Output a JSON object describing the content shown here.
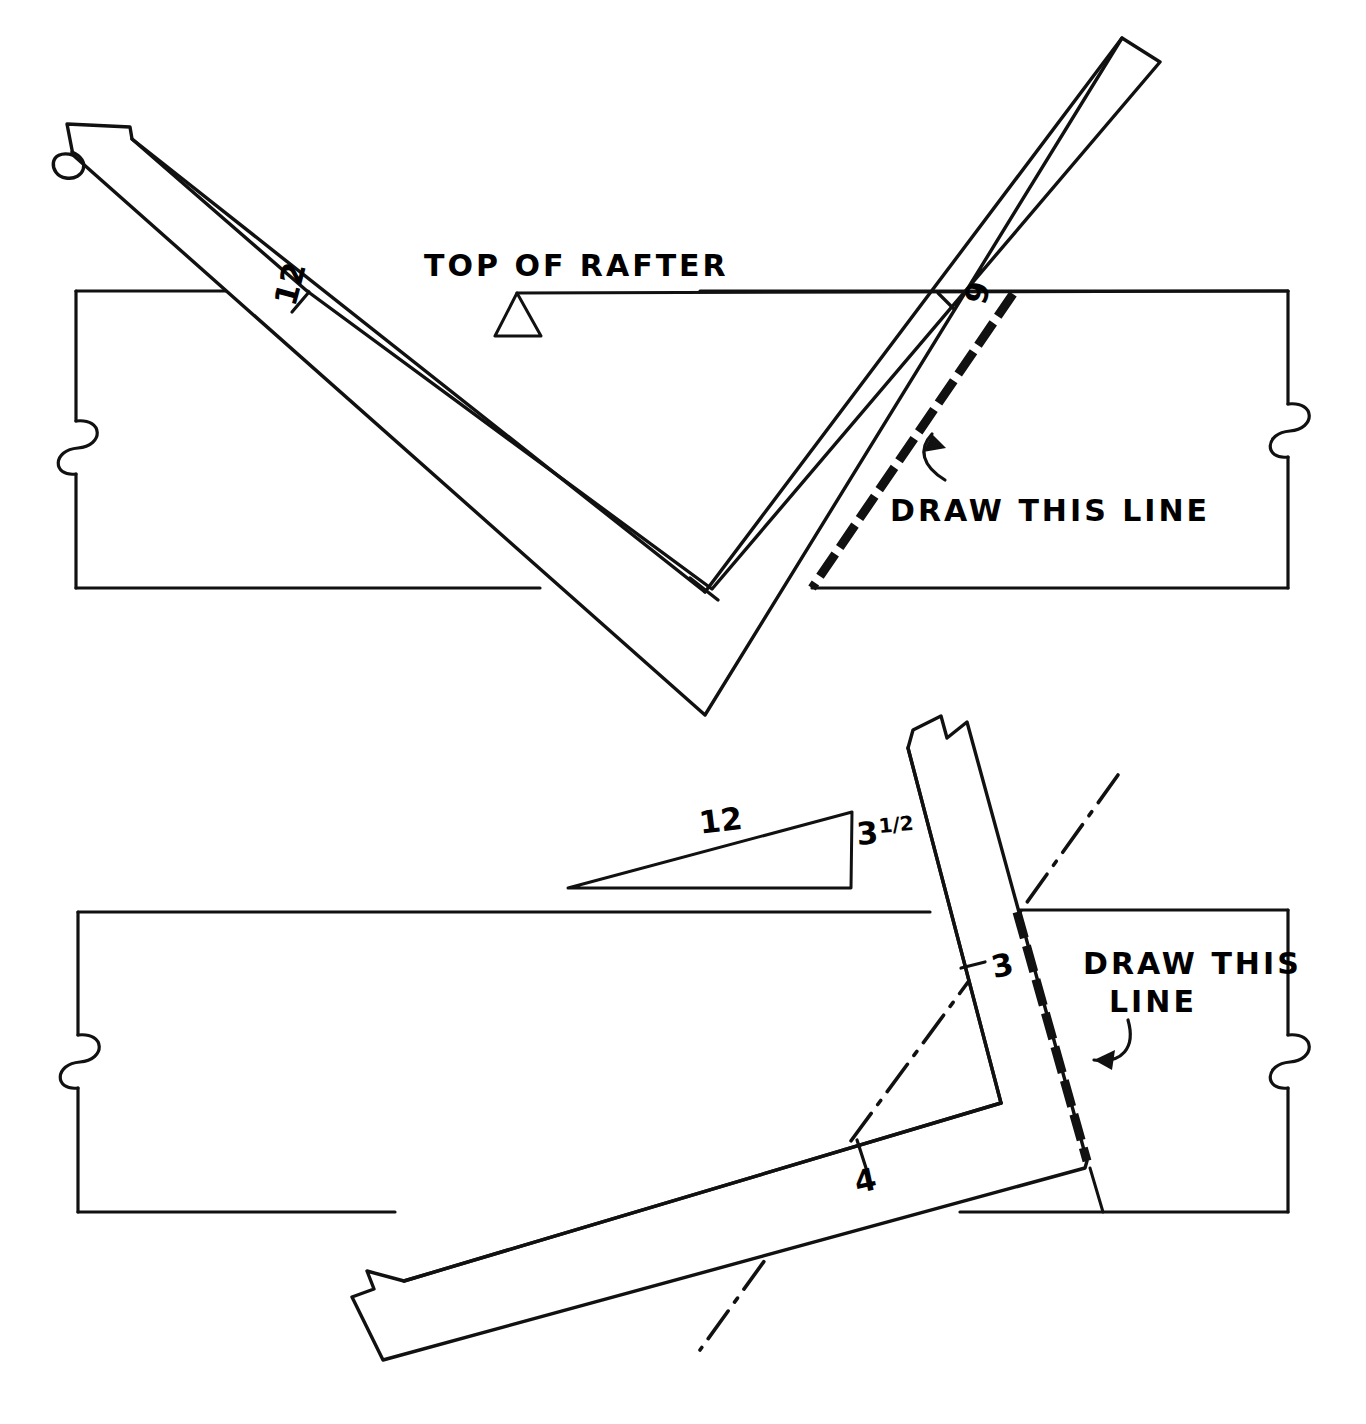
{
  "document": {
    "title": "Framing square layout on rafter stock",
    "background_color": "#ffffff",
    "ink_color": "#111111"
  },
  "figures": [
    {
      "id": "upper-figure",
      "name": "plumb-cut-layout",
      "description": "Framing square laid across rafter stock with 12 on the tongue and 9 on the body",
      "labels": {
        "top_of_rafter": "TOP OF RAFTER",
        "tongue_number": "12",
        "body_number": "9",
        "callout": "DRAW THIS LINE"
      }
    },
    {
      "id": "lower-figure",
      "name": "hip-valley-cheek-cut-layout",
      "description": "Framing square positioned using 3 and 4 with a 12 over 3 1/2 slope triangle",
      "labels": {
        "triangle_run": "12",
        "triangle_rise": "3",
        "triangle_rise_fraction": "1/2",
        "triangle_rise_full": "3 1/2",
        "tongue_number": "3",
        "body_number": "4",
        "callout_line1": "DRAW THIS",
        "callout_line2": "LINE"
      }
    }
  ],
  "icons": {
    "break_mark": "s-curve-break-symbol",
    "reference_triangle": "open-triangle-reference-mark",
    "slope_triangle": "slope-ratio-triangle",
    "centerline": "dash-dot-center-line",
    "callout_arrow": "curved-callout-arrow"
  }
}
